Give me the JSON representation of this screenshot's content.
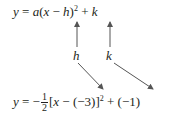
{
  "general_form": {
    "y": "y",
    "eq": " = ",
    "a": "a",
    "open": "(",
    "x": "x",
    "minus": " − ",
    "h": "h",
    "close": ")",
    "exp": "2",
    "plus": " + ",
    "k": "k"
  },
  "labels": {
    "h": "h",
    "k": "k"
  },
  "specific_form": {
    "y": "y",
    "eq": " = −",
    "frac_num": "1",
    "frac_den": "2",
    "bracket_open": "[",
    "x": "x",
    "minus": " − (−3)]",
    "exp": "2",
    "plus": " + (−1)"
  },
  "colors": {
    "text": "#231f20",
    "arrow": "#555555"
  }
}
